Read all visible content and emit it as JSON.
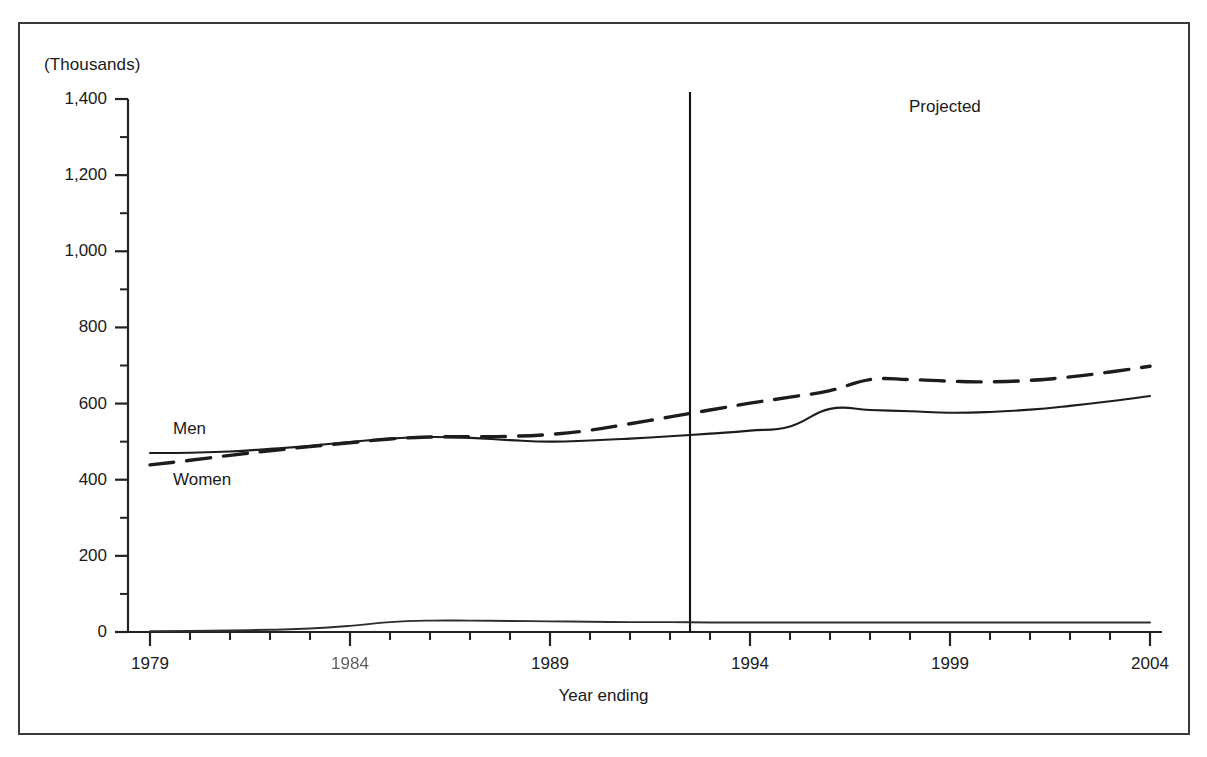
{
  "figure": {
    "unit_label": "(Thousands)",
    "x_axis_title": "Year ending",
    "projected_annotation": "Projected",
    "series_label_men": "Men",
    "series_label_women": "Women"
  },
  "chart_data": {
    "type": "line",
    "title": "",
    "subtitle": "",
    "xlabel": "Year ending",
    "ylabel": "(Thousands)",
    "xlim": [
      1979,
      2004
    ],
    "ylim": [
      0,
      1400
    ],
    "grid": false,
    "legend_position": "inline-labels",
    "y_ticks": [
      "0",
      "200",
      "400",
      "600",
      "800",
      "1,000",
      "1,200",
      "1,400"
    ],
    "y_tick_values": [
      0,
      200,
      400,
      600,
      800,
      1000,
      1200,
      1400
    ],
    "y_minor_tick_step": 100,
    "x_ticks": [
      "1979",
      "1984",
      "1989",
      "1994",
      "1999",
      "2004"
    ],
    "x_tick_values": [
      1979,
      1984,
      1989,
      1994,
      1999,
      2004
    ],
    "x_minor_tick_step": 1,
    "annotations": [
      {
        "text": "Projected",
        "x": 2000,
        "y": 1330
      },
      {
        "text": "Men",
        "x": 1981.2,
        "y": 530
      },
      {
        "text": "Women",
        "x": 1981.2,
        "y": 395
      }
    ],
    "projection_divider_x": 1992.5,
    "x": [
      1979,
      1980,
      1981,
      1982,
      1983,
      1984,
      1985,
      1986,
      1987,
      1988,
      1989,
      1990,
      1991,
      1992,
      1993,
      1994,
      1995,
      1996,
      1997,
      1998,
      1999,
      2000,
      2001,
      2002,
      2003,
      2004
    ],
    "series": [
      {
        "name": "Men",
        "style": "solid",
        "values": [
          470,
          471,
          474,
          481,
          489,
          499,
          508,
          512,
          510,
          504,
          500,
          503,
          508,
          514,
          521,
          529,
          540,
          586,
          583,
          580,
          576,
          578,
          584,
          594,
          606,
          620
        ]
      },
      {
        "name": "Women",
        "style": "dashed",
        "values": [
          439,
          451,
          464,
          476,
          487,
          497,
          507,
          512,
          513,
          514,
          519,
          530,
          547,
          565,
          583,
          601,
          617,
          634,
          663,
          663,
          659,
          657,
          661,
          670,
          683,
          698
        ]
      },
      {
        "name": "baseline",
        "style": "solid-thin",
        "values": [
          2,
          3,
          4,
          6,
          9,
          16,
          26,
          30,
          30,
          29,
          28,
          27,
          26,
          26,
          25,
          25,
          25,
          25,
          25,
          25,
          25,
          25,
          25,
          25,
          25,
          25
        ]
      }
    ]
  }
}
